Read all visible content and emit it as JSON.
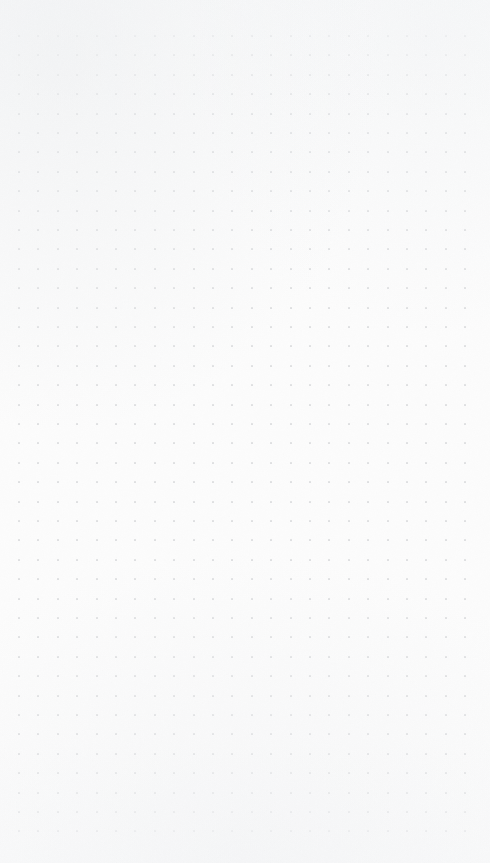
{
  "canvas": {
    "name": "blank-dot-grid-canvas",
    "width": 490,
    "height": 863,
    "background_color": "#fcfcfc",
    "surface_label": "Empty canvas",
    "content_state": "empty",
    "visible_objects_count": 0,
    "zoom_level": "100%"
  },
  "grid": {
    "style": "dot",
    "dot_color": "#dfe0e2",
    "dot_size_px": 2,
    "spacing_px": 19.4,
    "columns": 24,
    "rows": 42,
    "origin_x": 19,
    "origin_y": 36,
    "margin_left_px": 8,
    "margin_top_px": 26,
    "margin_right_px": 32,
    "margin_bottom_px": 30
  },
  "texture": {
    "grain_color": "#f2f3f5",
    "vignette_color": "#eceef0"
  }
}
